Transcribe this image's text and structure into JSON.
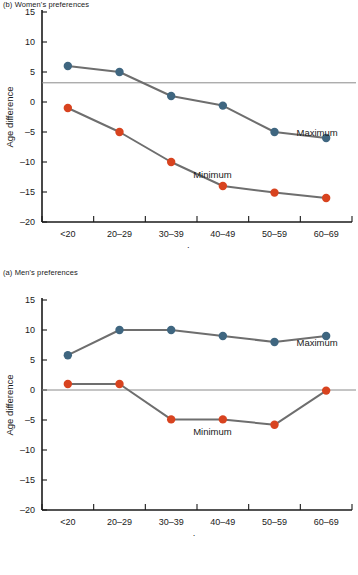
{
  "figure": {
    "panels": [
      {
        "id": "a",
        "caption": "(a) Men's preferences",
        "chart": {
          "type": "line",
          "title": "",
          "xlabel": "Male's age",
          "ylabel": "Age difference",
          "categories": [
            "<20",
            "20–29",
            "30–39",
            "40–49",
            "50–59",
            "60–69"
          ],
          "yticks": [
            15,
            10,
            5,
            0,
            -5,
            -10,
            -15,
            -20
          ],
          "ytick_labels": [
            "15",
            "10",
            "5",
            "0",
            "–5",
            "–10",
            "–15",
            "–20"
          ],
          "ylim": [
            -20,
            15
          ],
          "grid": false,
          "reference_line": {
            "value": 3.2,
            "label": ""
          },
          "series": [
            {
              "name": "Maximum",
              "color": "#3f6680",
              "label_x_category_index": 4,
              "values": [
                6,
                5,
                1,
                -0.6,
                -5,
                -6
              ]
            },
            {
              "name": "Minimum",
              "color": "#d8431f",
              "label_x_category_index": 2,
              "values": [
                -1,
                -5,
                -10,
                -14,
                -15.1,
                -16
              ]
            }
          ]
        }
      },
      {
        "id": "b",
        "caption": "(b) Women's preferences",
        "chart": {
          "type": "line",
          "title": "",
          "xlabel": "Female's age",
          "ylabel": "Age difference",
          "categories": [
            "<20",
            "20–29",
            "30–39",
            "40–49",
            "50–59",
            "60–69"
          ],
          "yticks": [
            15,
            10,
            5,
            0,
            -5,
            -10,
            -15,
            -20
          ],
          "ytick_labels": [
            "15",
            "10",
            "5",
            "0",
            "–5",
            "–10",
            "–15",
            "–20"
          ],
          "ylim": [
            -20,
            15
          ],
          "grid": false,
          "reference_line": {
            "value": 0,
            "label": ""
          },
          "series": [
            {
              "name": "Maximum",
              "color": "#3f6680",
              "label_x_category_index": 4,
              "values": [
                5.8,
                10,
                10,
                9,
                8,
                9
              ]
            },
            {
              "name": "Minimum",
              "color": "#d8431f",
              "label_x_category_index": 2,
              "values": [
                1,
                1,
                -4.9,
                -4.9,
                -5.8,
                -0.1
              ]
            }
          ]
        }
      }
    ],
    "colors": {
      "maximum": "#3f6680",
      "minimum": "#d8431f",
      "connector": "#6e6e6e",
      "axis": "#1a1a1a",
      "reference": "#8a8a8a"
    }
  }
}
